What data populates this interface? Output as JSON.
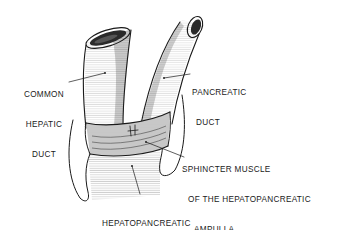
{
  "figure": {
    "type": "anatomical line drawing"
  },
  "labels": {
    "common_hepatic_duct": [
      "COMMON",
      "HEPATIC",
      "DUCT"
    ],
    "pancreatic_duct": [
      "PANCREATIC",
      "DUCT"
    ],
    "sphincter": [
      "SPHINCTER MUSCLE",
      "OF THE HEPATOPANCREATIC",
      "AMPULLA"
    ],
    "ampulla": [
      "HEPATOPANCREATIC",
      "AMPULLA (DIVERTICULUM DUODENI)"
    ]
  },
  "colors": {
    "ink": "#1a1a1a",
    "background": "#ffffff"
  }
}
